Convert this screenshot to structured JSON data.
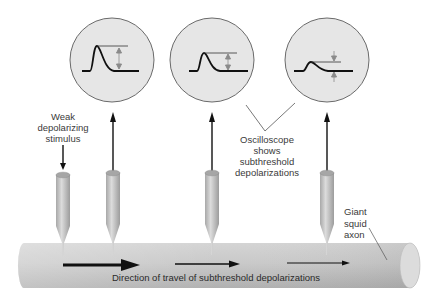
{
  "labels": {
    "stimulus": [
      "Weak",
      "depolarizing",
      "stimulus"
    ],
    "oscilloscope": [
      "Oscilloscope",
      "shows",
      "subthreshold",
      "depolarizations"
    ],
    "axon": [
      "Giant",
      "squid",
      "axon"
    ],
    "direction": "Direction of travel of subthreshold depolarizations"
  },
  "oscilloscopes": [
    {
      "position": 1,
      "amplitude": "large"
    },
    {
      "position": 2,
      "amplitude": "medium"
    },
    {
      "position": 3,
      "amplitude": "small"
    }
  ],
  "colors": {
    "scope_fill": "#e6e6e6",
    "scope_stroke": "#666666",
    "axon_fill": "#c8c8c8",
    "electrode_fill": "#bdbdbd",
    "arrow": "#111111",
    "measure_arrow": "#8a8a8a"
  }
}
